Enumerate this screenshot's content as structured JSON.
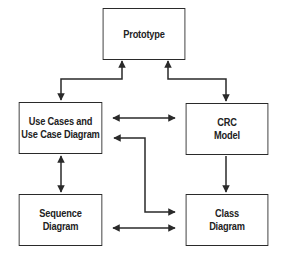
{
  "diagram": {
    "type": "flow",
    "colors": {
      "line": "#2a2a2a",
      "text": "#222222",
      "background": "#ffffff"
    },
    "nodes": [
      {
        "id": "prototype",
        "lines": [
          "Prototype"
        ]
      },
      {
        "id": "use_cases",
        "lines": [
          "Use Cases and",
          "Use Case Diagram"
        ]
      },
      {
        "id": "crc",
        "lines": [
          "CRC",
          "Model"
        ]
      },
      {
        "id": "sequence",
        "lines": [
          "Sequence",
          "Diagram"
        ]
      },
      {
        "id": "class",
        "lines": [
          "Class",
          "Diagram"
        ]
      }
    ],
    "edges": [
      {
        "from": "prototype",
        "to": "use_cases",
        "direction": "both"
      },
      {
        "from": "prototype",
        "to": "crc",
        "direction": "both"
      },
      {
        "from": "use_cases",
        "to": "crc",
        "direction": "both"
      },
      {
        "from": "use_cases",
        "to": "class",
        "direction": "both"
      },
      {
        "from": "use_cases",
        "to": "sequence",
        "direction": "both"
      },
      {
        "from": "crc",
        "to": "class",
        "direction": "forward"
      },
      {
        "from": "sequence",
        "to": "class",
        "direction": "both"
      }
    ]
  }
}
